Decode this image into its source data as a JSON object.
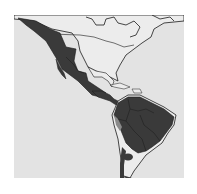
{
  "map": {
    "title": "Species range map — Americas",
    "region": "North, Central and South America",
    "colors": {
      "page_background": "#ffffff",
      "ocean": "#e3e3e3",
      "land_outside_range": "#e8e8e8",
      "range_primary": "#3a3a3a",
      "range_secondary": "#8a8a8a",
      "border": "#1a1a1a"
    },
    "legend": {
      "range_primary_label": "Primary range",
      "range_secondary_label": "Marginal range"
    }
  }
}
